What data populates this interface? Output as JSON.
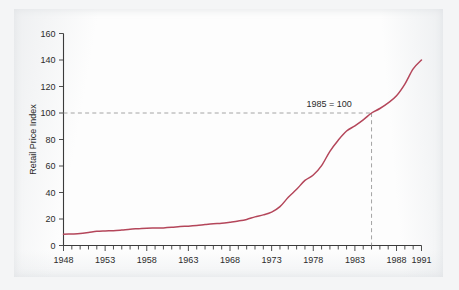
{
  "figure": {
    "background_color": "#f4f5f6",
    "paper_color": "#fdfdfd"
  },
  "chart_data": {
    "type": "line",
    "title": "",
    "subtitle": "",
    "xlabel": "",
    "ylabel": "Retail Price Index",
    "xlim": [
      1948,
      1991
    ],
    "ylim": [
      0,
      160
    ],
    "grid": false,
    "legend": null,
    "line_color": "#b4465a",
    "x_tick_labels": [
      "1948",
      "1953",
      "1958",
      "1963",
      "1968",
      "1973",
      "1978",
      "1983",
      "1988",
      "1991"
    ],
    "x_tick_values": [
      1948,
      1953,
      1958,
      1963,
      1968,
      1973,
      1978,
      1983,
      1988,
      1991
    ],
    "x_minor_tick_step": 1,
    "y_tick_labels": [
      "0",
      "20",
      "40",
      "60",
      "80",
      "100",
      "120",
      "140",
      "160"
    ],
    "y_tick_values": [
      0,
      20,
      40,
      60,
      80,
      100,
      120,
      140,
      160
    ],
    "annotations": [
      {
        "text": "1985 = 100",
        "x": 1985,
        "y": 100,
        "guide_color": "#9a9a9a",
        "guide_style": "dashed"
      }
    ],
    "series": [
      {
        "name": "Retail Price Index",
        "color": "#b4465a",
        "x": [
          1948,
          1949,
          1950,
          1951,
          1952,
          1953,
          1954,
          1955,
          1956,
          1957,
          1958,
          1959,
          1960,
          1961,
          1962,
          1963,
          1964,
          1965,
          1966,
          1967,
          1968,
          1969,
          1970,
          1971,
          1972,
          1973,
          1974,
          1975,
          1976,
          1977,
          1978,
          1979,
          1980,
          1981,
          1982,
          1983,
          1984,
          1985,
          1986,
          1987,
          1988,
          1989,
          1990,
          1991
        ],
        "values": [
          8.5,
          8.7,
          9.0,
          9.8,
          10.7,
          11.0,
          11.2,
          11.7,
          12.3,
          12.7,
          13.1,
          13.2,
          13.3,
          13.7,
          14.3,
          14.6,
          15.1,
          15.8,
          16.4,
          16.8,
          17.6,
          18.5,
          19.7,
          21.6,
          23.1,
          25.2,
          29.3,
          36.4,
          42.4,
          49.1,
          53.2,
          60.3,
          71.1,
          79.5,
          86.4,
          90.3,
          94.8,
          100.0,
          103.4,
          107.7,
          113.0,
          121.8,
          133.3,
          140.0
        ]
      }
    ]
  },
  "axis_title": {
    "y": "Retail Price Index"
  }
}
